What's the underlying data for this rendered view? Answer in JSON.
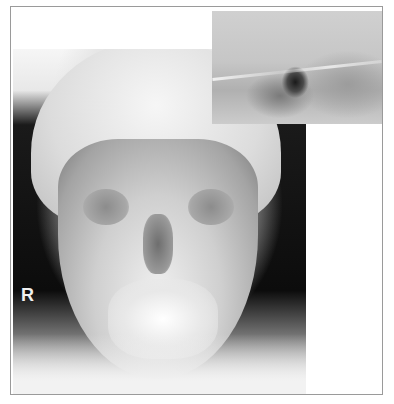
{
  "figure": {
    "main_image": {
      "kind": "xray-pa-cephalogram",
      "side_marker": "R"
    },
    "inset_image": {
      "kind": "xray-magnified-detail"
    },
    "colors": {
      "frame_border": "#9a9a9a",
      "background": "#ffffff",
      "marker_text": "#f0f0f0"
    }
  }
}
